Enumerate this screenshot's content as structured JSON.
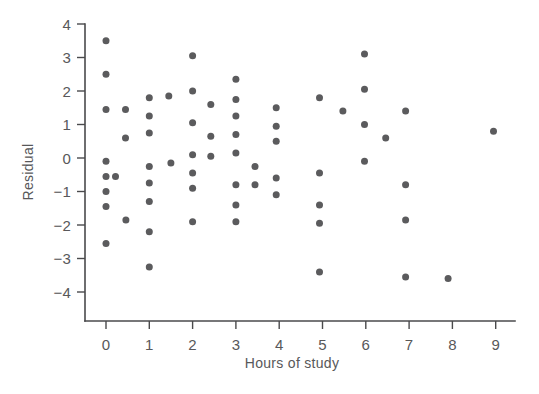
{
  "chart_data": {
    "type": "scatter",
    "title": "",
    "xlabel": "Hours of study",
    "ylabel": "Residual",
    "xlim": [
      -0.55,
      9.6
    ],
    "ylim": [
      -4.45,
      4.2
    ],
    "xticks": [
      0,
      1,
      2,
      3,
      4,
      5,
      6,
      7,
      8,
      9
    ],
    "xtick_labels": [
      "0",
      "1",
      "2",
      "3",
      "4",
      "5",
      "6",
      "7",
      "8",
      "9"
    ],
    "yticks": [
      -4,
      -3,
      -2,
      -1,
      0,
      1,
      2,
      3,
      4
    ],
    "ytick_labels": [
      "-4",
      "-3",
      "-2",
      "-1",
      "0",
      "1",
      "2",
      "3",
      "4"
    ],
    "grid": false,
    "legend": null,
    "marker": "circle",
    "marker_color": "#5b5b5d",
    "marker_size": 7,
    "n_points": 63,
    "points": [
      {
        "x": 0.0,
        "y": 3.5
      },
      {
        "x": 0.0,
        "y": 2.5
      },
      {
        "x": 0.0,
        "y": 1.45
      },
      {
        "x": 0.0,
        "y": -0.1
      },
      {
        "x": 0.0,
        "y": -0.55
      },
      {
        "x": 0.0,
        "y": -1.0
      },
      {
        "x": 0.0,
        "y": -1.45
      },
      {
        "x": 0.0,
        "y": -2.55
      },
      {
        "x": 0.22,
        "y": -0.55
      },
      {
        "x": 0.45,
        "y": 1.45
      },
      {
        "x": 0.45,
        "y": 0.6
      },
      {
        "x": 0.46,
        "y": -1.85
      },
      {
        "x": 1.0,
        "y": 1.8
      },
      {
        "x": 1.0,
        "y": 1.25
      },
      {
        "x": 1.0,
        "y": 0.75
      },
      {
        "x": 1.0,
        "y": -0.25
      },
      {
        "x": 1.0,
        "y": -0.75
      },
      {
        "x": 1.0,
        "y": -1.3
      },
      {
        "x": 1.0,
        "y": -2.2
      },
      {
        "x": 1.0,
        "y": -3.25
      },
      {
        "x": 1.45,
        "y": 1.85
      },
      {
        "x": 1.5,
        "y": -0.15
      },
      {
        "x": 2.0,
        "y": 3.05
      },
      {
        "x": 2.0,
        "y": 2.0
      },
      {
        "x": 2.0,
        "y": 1.05
      },
      {
        "x": 2.0,
        "y": 0.1
      },
      {
        "x": 2.0,
        "y": -0.45
      },
      {
        "x": 2.0,
        "y": -0.9
      },
      {
        "x": 2.0,
        "y": -1.9
      },
      {
        "x": 2.42,
        "y": 1.6
      },
      {
        "x": 2.42,
        "y": 0.65
      },
      {
        "x": 2.42,
        "y": 0.05
      },
      {
        "x": 3.0,
        "y": 2.35
      },
      {
        "x": 3.0,
        "y": 1.75
      },
      {
        "x": 3.0,
        "y": 1.25
      },
      {
        "x": 3.0,
        "y": 0.7
      },
      {
        "x": 3.0,
        "y": 0.15
      },
      {
        "x": 3.0,
        "y": -0.8
      },
      {
        "x": 3.0,
        "y": -1.4
      },
      {
        "x": 3.0,
        "y": -1.9
      },
      {
        "x": 3.44,
        "y": -0.25
      },
      {
        "x": 3.44,
        "y": -0.8
      },
      {
        "x": 3.93,
        "y": 1.5
      },
      {
        "x": 3.93,
        "y": 0.95
      },
      {
        "x": 3.93,
        "y": 0.5
      },
      {
        "x": 3.93,
        "y": -0.6
      },
      {
        "x": 3.93,
        "y": -1.1
      },
      {
        "x": 4.93,
        "y": 1.8
      },
      {
        "x": 4.93,
        "y": -0.45
      },
      {
        "x": 4.93,
        "y": -1.4
      },
      {
        "x": 4.93,
        "y": -1.95
      },
      {
        "x": 4.93,
        "y": -3.4
      },
      {
        "x": 5.47,
        "y": 1.4
      },
      {
        "x": 5.97,
        "y": 3.1
      },
      {
        "x": 5.97,
        "y": 2.05
      },
      {
        "x": 5.97,
        "y": 1.0
      },
      {
        "x": 5.97,
        "y": -0.1
      },
      {
        "x": 6.46,
        "y": 0.6
      },
      {
        "x": 6.92,
        "y": 1.4
      },
      {
        "x": 6.92,
        "y": -0.8
      },
      {
        "x": 6.92,
        "y": -1.85
      },
      {
        "x": 6.92,
        "y": -3.55
      },
      {
        "x": 7.9,
        "y": -3.6
      },
      {
        "x": 8.95,
        "y": 0.8
      }
    ]
  },
  "axes": {
    "y_title": "Residual",
    "x_title": "Hours of study"
  }
}
